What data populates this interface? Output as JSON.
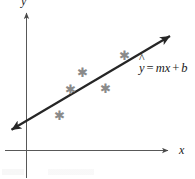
{
  "figure": {
    "background_color": "#ffffff",
    "axis_color": "#4a4a4a",
    "line_color": "#262626",
    "marker_color": "#8a8a8a",
    "text_color": "#1a1a1a"
  },
  "axes": {
    "x_label": "x",
    "y_label": "y",
    "x_axis": {
      "y_position": 150,
      "x_start": 5,
      "x_end": 174,
      "arrow": "right"
    },
    "y_axis": {
      "x_position": 26,
      "y_start": 178,
      "y_end": 6,
      "arrow": "up"
    },
    "grid": false,
    "ticks": []
  },
  "annotations": {
    "equation": {
      "full_text": "ŷ = mx + b",
      "y_variable": "y",
      "hat": "^",
      "equals": "=",
      "slope": "m",
      "x_variable": "x",
      "plus": "+",
      "intercept": "b"
    }
  },
  "chart_data": {
    "type": "scatter",
    "title": "",
    "subtitle": "",
    "xlabel": "x",
    "ylabel": "y",
    "grid": false,
    "legend": null,
    "marker_symbol": "asterisk",
    "marker_count": 5,
    "points": [
      {
        "px": 59,
        "py": 115,
        "label": "point-1"
      },
      {
        "px": 70,
        "py": 89,
        "label": "point-2"
      },
      {
        "px": 82,
        "py": 72,
        "label": "point-3"
      },
      {
        "px": 105,
        "py": 88,
        "label": "point-4"
      },
      {
        "px": 124,
        "py": 55,
        "label": "point-5"
      }
    ],
    "fit_line": {
      "type": "line",
      "name": "regression-line",
      "equation": "ŷ = mx + b",
      "arrows": "both",
      "x1": 9,
      "y1": 133,
      "x2": 177,
      "y2": 31
    },
    "axis_ranges": {
      "x": [
        0,
        1
      ],
      "y": [
        0,
        1
      ]
    }
  }
}
